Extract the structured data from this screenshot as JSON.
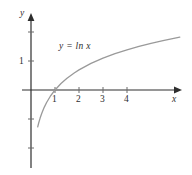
{
  "figure": {
    "background_color": "#ffffff",
    "axis_color": "#2e2e2e",
    "curve_color": "#9a9a9a",
    "text_color": "#2e2e2e",
    "width": 192,
    "height": 175
  },
  "labels": {
    "x_axis": "x",
    "y_axis": "y",
    "equation": "y = ln x"
  },
  "ticks": {
    "x": [
      "1",
      "2",
      "3",
      "4"
    ],
    "y": [
      "1"
    ]
  },
  "chart_data": {
    "type": "line",
    "title": "",
    "subtitle": "",
    "xlabel": "x",
    "ylabel": "y",
    "grid": false,
    "legend": "none",
    "annotations": [
      {
        "text": "y = ln x",
        "x": 1.2,
        "y": 1.5
      }
    ],
    "xlim": [
      -0.4,
      6.2
    ],
    "ylim": [
      -2.7,
      2.0
    ],
    "xticks": [
      1,
      2,
      3,
      4
    ],
    "yticks": [
      1
    ],
    "xtick_labels": [
      "1",
      "2",
      "3",
      "4"
    ],
    "ytick_labels": [
      "1"
    ],
    "series": [
      {
        "name": "y = ln x",
        "formula": "ln(x)",
        "color": "#9a9a9a",
        "x": [
          0.28,
          0.32,
          0.38,
          0.45,
          0.55,
          0.65,
          0.8,
          1.0,
          1.25,
          1.5,
          1.8,
          2.0,
          2.5,
          3.0,
          3.5,
          4.0,
          4.5,
          5.0,
          5.5,
          6.0,
          6.2
        ],
        "y": [
          -1.273,
          -1.139,
          -0.968,
          -0.799,
          -0.598,
          -0.431,
          -0.223,
          0.0,
          0.223,
          0.405,
          0.588,
          0.693,
          0.916,
          1.099,
          1.253,
          1.386,
          1.504,
          1.609,
          1.705,
          1.792,
          1.825
        ]
      }
    ]
  }
}
